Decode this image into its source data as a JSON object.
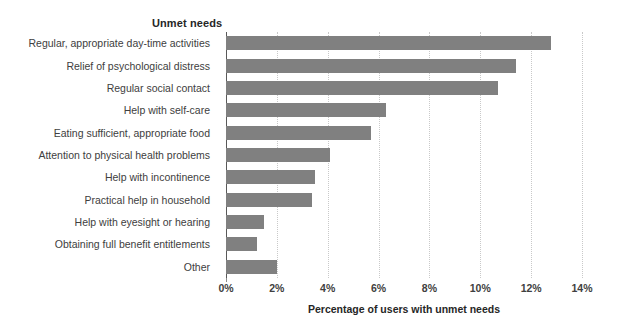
{
  "chart_data": {
    "type": "bar",
    "orientation": "horizontal",
    "title": "Unmet needs",
    "xlabel": "Percentage of users with unmet needs",
    "ylabel": "Unmet needs",
    "categories": [
      "Regular, appropriate day-time activities",
      "Relief of psychological distress",
      "Regular social contact",
      "Help with self-care",
      "Eating sufficient, appropriate food",
      "Attention to physical health problems",
      "Help with incontinence",
      "Practical help in household",
      "Help with eyesight or hearing",
      "Obtaining full benefit entitlements",
      "Other"
    ],
    "values": [
      12.8,
      11.4,
      10.7,
      6.3,
      5.7,
      4.1,
      3.5,
      3.4,
      1.5,
      1.2,
      2.0
    ],
    "xlim": [
      0,
      14
    ],
    "xticks": [
      0,
      2,
      4,
      6,
      8,
      10,
      12,
      14
    ],
    "xtick_labels": [
      "0%",
      "2%",
      "4%",
      "6%",
      "8%",
      "10%",
      "12%",
      "14%"
    ],
    "grid": true,
    "grid_axis": "x",
    "grid_style": "dotted",
    "legend": false,
    "bar_color": "#808080",
    "grid_color": "#c9c9c9",
    "axis_color": "#595959",
    "text_color": "#404040",
    "title_color": "#262626",
    "background": "#ffffff"
  }
}
